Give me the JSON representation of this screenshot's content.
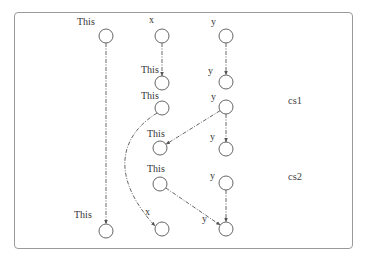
{
  "diagram": {
    "type": "points-to graph",
    "regions": [
      {
        "id": "cs1",
        "label": "cs1",
        "x": 288,
        "y": 96
      },
      {
        "id": "cs2",
        "label": "cs2",
        "x": 288,
        "y": 172
      }
    ],
    "nodes": [
      {
        "id": "n1",
        "label": "This",
        "cx": 106,
        "cy": 36,
        "lx": 77,
        "ly": 17
      },
      {
        "id": "n2",
        "label": "x",
        "cx": 162,
        "cy": 36,
        "lx": 149,
        "ly": 15
      },
      {
        "id": "n3",
        "label": "y",
        "cx": 226,
        "cy": 36,
        "lx": 211,
        "ly": 17
      },
      {
        "id": "n4",
        "label": "This",
        "cx": 162,
        "cy": 83,
        "lx": 141,
        "ly": 65
      },
      {
        "id": "n5",
        "label": "y",
        "cx": 226,
        "cy": 82,
        "lx": 208,
        "ly": 66
      },
      {
        "id": "n6",
        "label": "This",
        "cx": 162,
        "cy": 108,
        "lx": 141,
        "ly": 91
      },
      {
        "id": "n7",
        "label": "y",
        "cx": 226,
        "cy": 107,
        "lx": 211,
        "ly": 92
      },
      {
        "id": "n8",
        "label": "This",
        "cx": 160,
        "cy": 148,
        "lx": 147,
        "ly": 129
      },
      {
        "id": "n9",
        "label": "y",
        "cx": 226,
        "cy": 149,
        "lx": 210,
        "ly": 132
      },
      {
        "id": "n10",
        "label": "This",
        "cx": 160,
        "cy": 184,
        "lx": 147,
        "ly": 164
      },
      {
        "id": "n11",
        "label": "y",
        "cx": 226,
        "cy": 183,
        "lx": 210,
        "ly": 171
      },
      {
        "id": "n12",
        "label": "This",
        "cx": 106,
        "cy": 231,
        "lx": 74,
        "ly": 210
      },
      {
        "id": "n13",
        "label": "x",
        "cx": 162,
        "cy": 229,
        "lx": 145,
        "ly": 207
      },
      {
        "id": "n14",
        "label": "y",
        "cx": 226,
        "cy": 229,
        "lx": 202,
        "ly": 214
      }
    ],
    "edges": [
      {
        "from": "n1",
        "to": "n12",
        "style": "dash-dot",
        "shape": "straight"
      },
      {
        "from": "n2",
        "to": "n4",
        "style": "dash-dot",
        "shape": "straight"
      },
      {
        "from": "n3",
        "to": "n5",
        "style": "dash-dot",
        "shape": "straight"
      },
      {
        "from": "n6",
        "to": "n13",
        "style": "dash-dot",
        "shape": "curved"
      },
      {
        "from": "n7",
        "to": "n8",
        "style": "dash-dot",
        "shape": "straight"
      },
      {
        "from": "n7",
        "to": "n9",
        "style": "dash-dot",
        "shape": "straight"
      },
      {
        "from": "n10",
        "to": "n14",
        "style": "dash-dot",
        "shape": "straight"
      },
      {
        "from": "n11",
        "to": "n14",
        "style": "dash-dot",
        "shape": "straight"
      }
    ],
    "colors": {
      "node_stroke": "#555555",
      "edge": "#555555",
      "frame": "#9a9a9a",
      "text": "#333333"
    }
  }
}
